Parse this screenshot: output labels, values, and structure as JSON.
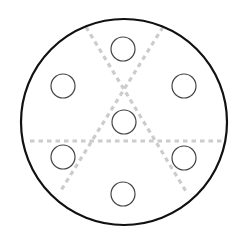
{
  "diagram": {
    "outer_circle": {
      "cx": 124,
      "cy": 122,
      "r": 103,
      "stroke": "#111111",
      "stroke_width": 2.2
    },
    "holes": [
      {
        "id": "top",
        "cx": 123,
        "cy": 49,
        "r": 12
      },
      {
        "id": "upper-left",
        "cx": 63,
        "cy": 86,
        "r": 12
      },
      {
        "id": "upper-right",
        "cx": 184,
        "cy": 86,
        "r": 12
      },
      {
        "id": "center",
        "cx": 124,
        "cy": 122,
        "r": 12
      },
      {
        "id": "lower-left",
        "cx": 63,
        "cy": 157,
        "r": 12
      },
      {
        "id": "lower-right",
        "cx": 184,
        "cy": 158,
        "r": 12
      },
      {
        "id": "bottom",
        "cx": 123,
        "cy": 194,
        "r": 12
      }
    ],
    "hole_stroke": "#444444",
    "dashed_lines": [
      {
        "id": "horizontal",
        "x1": 30,
        "y1": 141,
        "x2": 222,
        "y2": 141
      },
      {
        "id": "diagonal-down-right",
        "x1": 86,
        "y1": 27,
        "x2": 187,
        "y2": 193
      },
      {
        "id": "diagonal-down-left",
        "x1": 163,
        "y1": 27,
        "x2": 60,
        "y2": 192
      }
    ],
    "dash_color": "#cccccc"
  }
}
